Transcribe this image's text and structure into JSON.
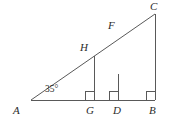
{
  "figure": {
    "background_color": "#ffffff",
    "stroke_color": "#595959",
    "label_color": "#2b2b2b"
  },
  "labels": {
    "A": "A",
    "B": "B",
    "C": "C",
    "D": "D",
    "F": "F",
    "G": "G",
    "H": "H",
    "angle_A": "35°"
  },
  "geometry": {
    "points": {
      "A": {
        "x": 31,
        "y": 100
      },
      "B": {
        "x": 155,
        "y": 100
      },
      "C": {
        "x": 155,
        "y": 14
      },
      "D": {
        "x": 118,
        "y": 100
      },
      "F": {
        "x": 118,
        "y": 74
      },
      "G": {
        "x": 94,
        "y": 100
      },
      "H": {
        "x": 94,
        "y": 56
      }
    },
    "segments": [
      {
        "name": "base-AB",
        "from": "A",
        "to": "B"
      },
      {
        "name": "hypotenuse-AC",
        "from": "A",
        "to": "C"
      },
      {
        "name": "altitude-CB",
        "from": "C",
        "to": "B"
      },
      {
        "name": "altitude-FD",
        "from": "F",
        "to": "D"
      },
      {
        "name": "altitude-HG",
        "from": "H",
        "to": "G"
      }
    ],
    "right_angles": [
      {
        "name": "right-angle-G",
        "x": 94,
        "y": 100
      },
      {
        "name": "right-angle-D",
        "x": 118,
        "y": 100
      },
      {
        "name": "right-angle-B",
        "x": 155,
        "y": 100
      }
    ],
    "right_angle_size": 9
  },
  "label_positions": {
    "A": {
      "left": 13,
      "top": 105
    },
    "B": {
      "left": 149,
      "top": 105
    },
    "C": {
      "left": 150,
      "top": 1
    },
    "D": {
      "left": 113,
      "top": 105
    },
    "F": {
      "left": 108,
      "top": 20
    },
    "G": {
      "left": 86,
      "top": 105
    },
    "H": {
      "left": 80,
      "top": 42
    },
    "angle_A": {
      "left": 45,
      "top": 85
    }
  }
}
